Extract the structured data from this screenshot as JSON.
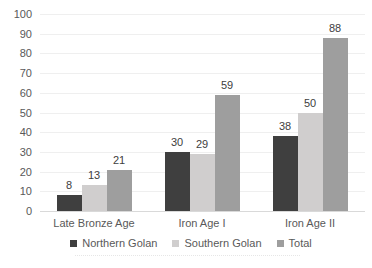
{
  "chart_data": {
    "type": "bar",
    "title": "",
    "categories": [
      "Late Bronze Age",
      "Iron Age I",
      "Iron Age II"
    ],
    "series": [
      {
        "name": "Northern Golan",
        "color": "#3f3f3f",
        "values": [
          8,
          30,
          38
        ]
      },
      {
        "name": "Southern Golan",
        "color": "#d0cece",
        "values": [
          13,
          29,
          50
        ]
      },
      {
        "name": "Total",
        "color": "#9e9e9e",
        "values": [
          21,
          59,
          88
        ]
      }
    ],
    "data_labels_shown": true,
    "xlabel": "",
    "ylabel": "",
    "ylim": [
      0,
      100
    ],
    "yticks": [
      0,
      10,
      20,
      30,
      40,
      50,
      60,
      70,
      80,
      90,
      100
    ],
    "grid": "horizontal",
    "legend_position": "bottom",
    "colors": {
      "axis_text": "#595959",
      "value_label_text": "#404040",
      "gridline": "#efefef",
      "axis_line": "#d9d9d9",
      "background": "#ffffff"
    }
  }
}
